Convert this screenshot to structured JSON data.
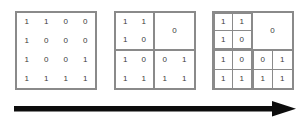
{
  "figure": {
    "background_color": "#ffffff",
    "line_color": "#8a8a8a",
    "digit_color": "#3b3b3b",
    "arrow_color": "#0d0d0d"
  },
  "arrow": {
    "name": "progression-arrow",
    "direction": "right",
    "label": ""
  },
  "stages": [
    {
      "name": "stage-0-full-matrix",
      "subdivided": false,
      "rows": [
        [
          "1",
          "1",
          "0",
          "0"
        ],
        [
          "1",
          "0",
          "0",
          "0"
        ],
        [
          "1",
          "0",
          "0",
          "1"
        ],
        [
          "1",
          "1",
          "1",
          "1"
        ]
      ]
    },
    {
      "name": "stage-1-quadrant-split",
      "subdivided": true,
      "quadrants": [
        {
          "name": "top-left",
          "merged": false,
          "outlined": false,
          "cells": [
            "1",
            "1",
            "1",
            "0"
          ]
        },
        {
          "name": "top-right",
          "merged": true,
          "outlined": false,
          "value": "0"
        },
        {
          "name": "bottom-left",
          "merged": false,
          "outlined": false,
          "cells": [
            "1",
            "0",
            "1",
            "1"
          ]
        },
        {
          "name": "bottom-right",
          "merged": false,
          "outlined": false,
          "cells": [
            "0",
            "1",
            "1",
            "1"
          ]
        }
      ]
    },
    {
      "name": "stage-2-cell-split",
      "subdivided": true,
      "quadrants": [
        {
          "name": "top-left",
          "merged": false,
          "outlined": true,
          "cells": [
            "1",
            "1",
            "1",
            "0"
          ]
        },
        {
          "name": "top-right",
          "merged": true,
          "outlined": false,
          "value": "0"
        },
        {
          "name": "bottom-left",
          "merged": false,
          "outlined": true,
          "cells": [
            "1",
            "0",
            "1",
            "1"
          ]
        },
        {
          "name": "bottom-right",
          "merged": false,
          "outlined": true,
          "cells": [
            "0",
            "1",
            "1",
            "1"
          ]
        }
      ]
    }
  ]
}
